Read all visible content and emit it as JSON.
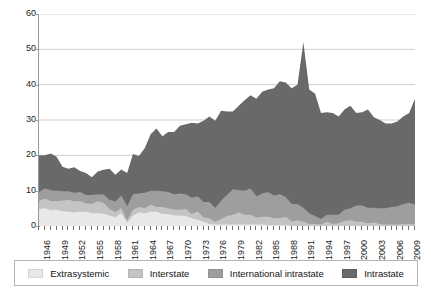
{
  "chart_data": {
    "type": "area",
    "stacked": true,
    "title": "",
    "xlabel": "",
    "ylabel": "",
    "ylim": [
      0,
      60
    ],
    "yticks": [
      0,
      10,
      20,
      30,
      40,
      50,
      60
    ],
    "grid": true,
    "grid_axis": "y",
    "legend_position": "bottom",
    "x": [
      1946,
      1947,
      1948,
      1949,
      1950,
      1951,
      1952,
      1953,
      1954,
      1955,
      1956,
      1957,
      1958,
      1959,
      1960,
      1961,
      1962,
      1963,
      1964,
      1965,
      1966,
      1967,
      1968,
      1969,
      1970,
      1971,
      1972,
      1973,
      1974,
      1975,
      1976,
      1977,
      1978,
      1979,
      1980,
      1981,
      1982,
      1983,
      1984,
      1985,
      1986,
      1987,
      1988,
      1989,
      1990,
      1991,
      1992,
      1993,
      1994,
      1995,
      1996,
      1997,
      1998,
      1999,
      2000,
      2001,
      2002,
      2003,
      2004,
      2005,
      2006,
      2007,
      2008,
      2009,
      2010
    ],
    "xtick_labels": [
      "1946",
      "1949",
      "1952",
      "1955",
      "1958",
      "1961",
      "1964",
      "1967",
      "1970",
      "1973",
      "1976",
      "1979",
      "1982",
      "1985",
      "1988",
      "1991",
      "1994",
      "1997",
      "2000",
      "2003",
      "2006",
      "2009"
    ],
    "xtick_step": 3,
    "series": [
      {
        "name": "Extrasystemic",
        "color": "#e8e8e8",
        "values": [
          4.8,
          5.0,
          4.5,
          4.6,
          4.2,
          4.0,
          3.8,
          4.0,
          4.0,
          3.6,
          3.6,
          3.5,
          3.0,
          2.5,
          3.6,
          1.0,
          3.0,
          3.8,
          3.6,
          4.0,
          4.0,
          3.4,
          3.4,
          3.0,
          3.0,
          2.8,
          2.2,
          1.8,
          1.2,
          0.6,
          0.4,
          0.4,
          0.4,
          0.4,
          0.4,
          0.4,
          0.4,
          0.4,
          0.4,
          0.2,
          0.2,
          0.2,
          0.2,
          0.0,
          0.0,
          0.0,
          0.0,
          0.0,
          0.0,
          0.0,
          0.0,
          0.0,
          0.0,
          0.0,
          0.0,
          0.0,
          0.0,
          0.0,
          0.0,
          0.0,
          0.0,
          0.0,
          0.0,
          0.0,
          0.0
        ]
      },
      {
        "name": "Interstate",
        "color": "#c4c4c4",
        "values": [
          2.2,
          2.8,
          2.6,
          2.4,
          3.0,
          3.4,
          3.2,
          3.0,
          2.4,
          2.6,
          3.4,
          3.0,
          1.8,
          1.4,
          1.4,
          0.6,
          1.6,
          1.6,
          1.4,
          2.0,
          1.4,
          2.0,
          1.6,
          1.6,
          1.6,
          2.0,
          1.2,
          2.4,
          1.2,
          1.6,
          0.8,
          1.6,
          2.4,
          2.8,
          3.4,
          2.8,
          2.8,
          2.0,
          2.2,
          2.4,
          2.0,
          2.0,
          2.4,
          1.2,
          1.6,
          1.2,
          0.6,
          0.6,
          0.4,
          1.2,
          0.6,
          0.8,
          1.4,
          1.6,
          1.2,
          1.2,
          0.8,
          1.0,
          0.6,
          0.4,
          0.4,
          0.4,
          0.6,
          0.6,
          0.4
        ]
      },
      {
        "name": "International intrastate",
        "color": "#9e9e9e",
        "values": [
          2.6,
          2.8,
          3.0,
          3.0,
          2.6,
          2.4,
          2.4,
          2.6,
          2.4,
          2.6,
          2.0,
          2.4,
          2.6,
          3.0,
          3.6,
          4.0,
          4.4,
          3.8,
          4.4,
          4.0,
          4.6,
          4.4,
          4.6,
          4.4,
          4.6,
          4.2,
          4.6,
          4.2,
          4.4,
          4.6,
          4.0,
          5.2,
          6.0,
          7.2,
          6.4,
          6.8,
          7.4,
          6.0,
          6.6,
          7.0,
          6.4,
          6.8,
          5.6,
          5.0,
          4.6,
          4.0,
          3.0,
          2.2,
          1.6,
          2.0,
          2.6,
          2.4,
          3.2,
          3.4,
          4.6,
          4.6,
          4.4,
          4.2,
          4.4,
          4.6,
          5.0,
          5.2,
          5.6,
          6.0,
          5.6
        ]
      },
      {
        "name": "Intrastate",
        "color": "#696969",
        "values": [
          10.4,
          9.4,
          10.4,
          9.6,
          7.0,
          6.4,
          7.2,
          6.0,
          6.2,
          5.0,
          6.4,
          7.0,
          8.8,
          7.6,
          7.4,
          9.4,
          11.4,
          10.6,
          12.6,
          16.0,
          17.6,
          15.6,
          17.0,
          17.6,
          19.2,
          19.8,
          21.2,
          20.6,
          23.0,
          24.2,
          24.6,
          25.4,
          23.6,
          22.0,
          23.8,
          25.6,
          26.4,
          27.6,
          28.8,
          29.0,
          30.4,
          32.0,
          32.4,
          32.8,
          33.8,
          46.8,
          35.0,
          34.6,
          30.0,
          29.0,
          28.8,
          27.8,
          28.4,
          29.0,
          26.2,
          26.4,
          27.8,
          25.6,
          25.0,
          24.0,
          23.6,
          24.0,
          24.8,
          25.4,
          30.0
        ]
      }
    ]
  },
  "legend": {
    "items": [
      {
        "label": "Extrasystemic"
      },
      {
        "label": "Interstate"
      },
      {
        "label": "International intrastate"
      },
      {
        "label": "Intrastate"
      }
    ]
  },
  "axis": {
    "y_labels": [
      "60",
      "50",
      "40",
      "30",
      "20",
      "10",
      "0"
    ]
  }
}
